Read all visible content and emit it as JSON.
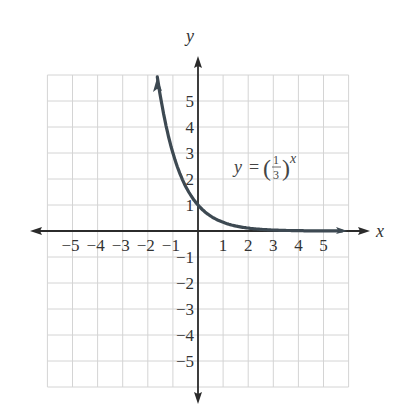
{
  "chart_data": {
    "type": "line",
    "title": "",
    "xlabel": "x",
    "ylabel": "y",
    "xlim": [
      -6,
      6
    ],
    "ylim": [
      -6,
      6
    ],
    "grid": true,
    "x_ticks": [
      "-5",
      "-4",
      "-3",
      "-2",
      "-1",
      "1",
      "2",
      "3",
      "4",
      "5"
    ],
    "y_ticks": [
      "5",
      "4",
      "3",
      "2",
      "1",
      "-1",
      "-2",
      "-3",
      "-4",
      "-5"
    ],
    "series": [
      {
        "name": "y = (1/3)^x",
        "function": "(1/3)^x",
        "x": [
          -1.6,
          -1.5,
          -1,
          -0.5,
          0,
          0.5,
          1,
          2,
          3,
          4,
          5,
          5.8
        ],
        "values": [
          5.8,
          5.2,
          3,
          1.73,
          1,
          0.58,
          0.33,
          0.11,
          0.04,
          0.01,
          0.004,
          0.002
        ]
      }
    ],
    "annotations": [
      {
        "text": "y = (1/3)^x",
        "x": 1.5,
        "y": 2.3
      }
    ]
  },
  "labels": {
    "x_axis": "x",
    "y_axis": "y",
    "eq_y": "y",
    "eq_equals": "=",
    "eq_num": "1",
    "eq_den": "3",
    "eq_exp": "x",
    "eq_lparen": "(",
    "eq_rparen": ")"
  },
  "colors": {
    "grid": "#d4d4d4",
    "axis": "#2b2b2b",
    "curve": "#3d4952"
  }
}
